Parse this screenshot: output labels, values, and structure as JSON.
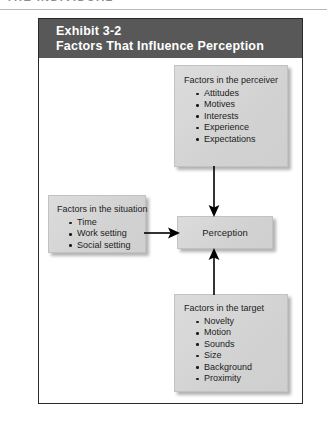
{
  "page_header": {
    "text": "THE INDIVIDUAL"
  },
  "exhibit": {
    "number": "Exhibit 3-2",
    "title": "Factors That Influence Perception",
    "header_bg": "#585858",
    "box_bg": "#d6d6d6",
    "frame_border": "#2a2a2a"
  },
  "boxes": {
    "perceiver": {
      "title": "Factors in the perceiver",
      "items": [
        "Attitudes",
        "Motives",
        "Interests",
        "Experience",
        "Expectations"
      ]
    },
    "situation": {
      "title": "Factors in the situation",
      "items": [
        "Time",
        "Work setting",
        "Social setting"
      ]
    },
    "target": {
      "title": "Factors in the target",
      "items": [
        "Novelty",
        "Motion",
        "Sounds",
        "Size",
        "Background",
        "Proximity"
      ]
    },
    "perception": {
      "title": "Perception"
    }
  },
  "arrows": [
    {
      "name": "perceiver-to-perception",
      "direction": "down"
    },
    {
      "name": "situation-to-perception",
      "direction": "right"
    },
    {
      "name": "target-to-perception",
      "direction": "up"
    }
  ]
}
